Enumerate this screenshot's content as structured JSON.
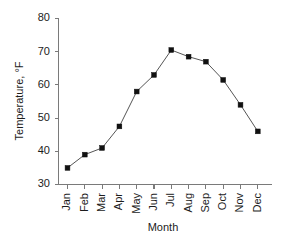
{
  "chart_data": {
    "type": "line",
    "title": "",
    "xlabel": "Month",
    "ylabel": "Temperature, °F",
    "categories": [
      "Jan",
      "Feb",
      "Mar",
      "Apr",
      "May",
      "Jun",
      "Jul",
      "Aug",
      "Sep",
      "Oct",
      "Nov",
      "Dec"
    ],
    "values": [
      35,
      39,
      41,
      47.5,
      58,
      63,
      70.5,
      68.5,
      67,
      61.5,
      54,
      46
    ],
    "series": [
      {
        "name": "Temperature",
        "values": [
          35,
          39,
          41,
          47.5,
          58,
          63,
          70.5,
          68.5,
          67,
          61.5,
          54,
          46
        ]
      }
    ],
    "ylim": [
      30,
      80
    ],
    "y_ticks": [
      30,
      40,
      50,
      60,
      70,
      80
    ],
    "y_tick_labels": [
      "30",
      "40",
      "50",
      "60",
      "70",
      "80"
    ],
    "x_tick_labels": [
      "Jan",
      "Feb",
      "Mar",
      "Apr",
      "May",
      "Jun",
      "Jul",
      "Aug",
      "Sep",
      "Oct",
      "Nov",
      "Dec"
    ],
    "grid": false,
    "legend": false,
    "legend_position": "none",
    "marker": "square",
    "line_color": "#555555",
    "marker_color": "#111111",
    "axis_color": "#7a7a7a",
    "background_color": "#ffffff",
    "xtick_label_rotation": 90
  },
  "axes": {
    "y_label": "Temperature, °F",
    "x_label": "Month",
    "y_tick_0": "30",
    "y_tick_1": "40",
    "y_tick_2": "50",
    "y_tick_3": "60",
    "y_tick_4": "70",
    "y_tick_5": "80",
    "x_tick_0": "Jan",
    "x_tick_1": "Feb",
    "x_tick_2": "Mar",
    "x_tick_3": "Apr",
    "x_tick_4": "May",
    "x_tick_5": "Jun",
    "x_tick_6": "Jul",
    "x_tick_7": "Aug",
    "x_tick_8": "Sep",
    "x_tick_9": "Oct",
    "x_tick_10": "Nov",
    "x_tick_11": "Dec"
  }
}
